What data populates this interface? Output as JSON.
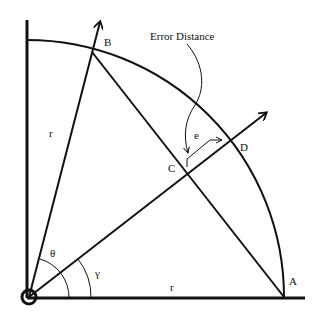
{
  "diagram": {
    "labels": {
      "error_distance": "Error Distance",
      "point_a": "A",
      "point_b": "B",
      "point_c": "C",
      "point_d": "D",
      "error_e": "e",
      "radius_vertical": "r",
      "radius_horizontal": "r",
      "angle_theta": "θ",
      "angle_gamma": "γ"
    },
    "colors": {
      "stroke": "#111111",
      "background": "#ffffff"
    }
  }
}
